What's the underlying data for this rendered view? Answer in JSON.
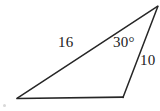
{
  "figure": {
    "background_color": "#ffffff",
    "stroke_color": "#262626",
    "text_color": "#1a1a1a",
    "labels": {
      "side_long": "16",
      "angle_apex": "30°",
      "side_short": "10"
    },
    "vertices": {
      "bottom_left": "17,98",
      "bottom_right": "123,98",
      "apex_top_right": "158,6"
    },
    "edges": {
      "base": "17,98 123,98",
      "long_side": "17,98 158,6",
      "short_side": "123,98 158,6"
    }
  }
}
